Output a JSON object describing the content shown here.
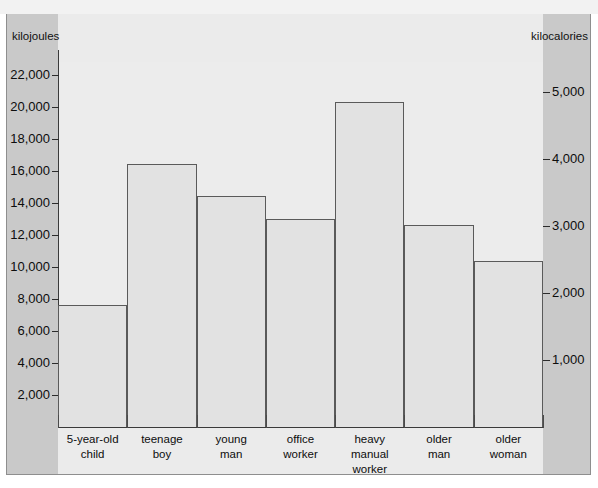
{
  "chart_data": {
    "type": "bar",
    "title": "",
    "subtitle": "",
    "categories": [
      "5-year-old child",
      "teenage boy",
      "young man",
      "office worker",
      "heavy manual worker",
      "older man",
      "older woman"
    ],
    "category_lines": [
      [
        "5-year-old",
        "child"
      ],
      [
        "teenage",
        "boy"
      ],
      [
        "young",
        "man"
      ],
      [
        "office",
        "worker"
      ],
      [
        "heavy",
        "manual",
        "worker"
      ],
      [
        "older",
        "man"
      ],
      [
        "older",
        "woman"
      ]
    ],
    "values": [
      7600,
      16400,
      14400,
      13000,
      20300,
      12600,
      10400
    ],
    "values_kilocalories": [
      1820,
      3920,
      3440,
      3110,
      4850,
      3010,
      2490
    ],
    "xlabel": "",
    "ylabel": "kilojoules",
    "ylabel_right": "kilocalories",
    "ylim": [
      0,
      22800
    ],
    "ylim_right": [
      0,
      5450
    ],
    "yticks": [
      2000,
      4000,
      6000,
      8000,
      10000,
      12000,
      14000,
      16000,
      18000,
      20000,
      22000
    ],
    "ytick_labels": [
      "2,000",
      "4,000",
      "6,000",
      "8,000",
      "10,000",
      "12,000",
      "14,000",
      "16,000",
      "18,000",
      "20,000",
      "22,000"
    ],
    "yticks_right": [
      1000,
      2000,
      3000,
      4000,
      5000
    ],
    "ytick_labels_right": [
      "1,000",
      "2,000",
      "3,000",
      "4,000",
      "5,000"
    ],
    "grid": false,
    "legend": false
  },
  "axes": {
    "left_unit": "kilojoules",
    "right_unit": "kilocalories"
  },
  "colors": {
    "bar_fill": "#e2e2e2",
    "bar_stroke": "#5a5a5a",
    "plot_background": "#ececec",
    "gutter_background": "#c9c9c9",
    "axis": "#3a3a3a",
    "text": "#0d0d0d"
  }
}
